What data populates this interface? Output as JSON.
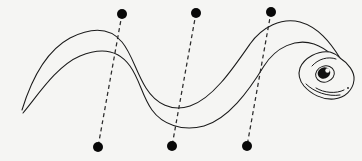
{
  "figure": {
    "background_color": "#f5f5f3",
    "ink_color": "#1a1a1a",
    "width": 362,
    "height": 161
  },
  "subject": {
    "name": "snake",
    "orientation": "head-right",
    "body_style": "double-line sinuous outline",
    "tail_tip": {
      "x": 22,
      "y": 108
    },
    "head_tip": {
      "x": 352,
      "y": 84
    },
    "dorsal_curve": "M 22 110 C 30 84 44 52 70 38 C 96 25 112 30 122 42 C 132 54 136 72 146 88 C 156 104 172 112 190 106 C 212 99 232 70 250 44 C 262 27 282 17 300 22 C 318 27 330 42 340 58",
    "ventral_curve": "M 23 113 C 36 98 56 66 80 56 C 104 46 120 52 130 66 C 140 80 142 96 152 110 C 162 124 182 132 204 126 C 228 119 248 92 264 66 C 276 47 296 38 314 44 C 328 49 338 60 344 72",
    "head": {
      "outline": "M 340 58 C 348 63 355 72 354 80 C 353 90 345 98 334 99 C 322 100 311 94 304 86 C 299 80 298 74 300 68 C 304 58 318 50 330 52 C 334 53 337 55 340 58 Z",
      "mouth_line": "M 316 88 C 324 93 336 94 344 90",
      "jaw_line": "M 306 84 C 314 92 328 97 340 95",
      "brow_line": "M 312 66 C 318 59 328 56 336 59",
      "eye": {
        "center": {
          "x": 325,
          "y": 74
        },
        "rx": 9.5,
        "ry": 8.0,
        "rotation": -18,
        "pupil_center": {
          "x": 324,
          "y": 73
        },
        "pupil_rx": 6.4,
        "pupil_ry": 5.6,
        "highlight_center": {
          "x": 327.5,
          "y": 70.5
        },
        "highlight_r": 2.2
      },
      "nostril": {
        "x": 348,
        "y": 88,
        "r": 0.9
      }
    }
  },
  "transects": [
    {
      "id": "transect-1",
      "label": "left transect",
      "top_point": {
        "x": 122,
        "y": 14
      },
      "bottom_point": {
        "x": 98,
        "y": 147
      },
      "dot_radius": 5.0,
      "dash_pattern": "4 3.2"
    },
    {
      "id": "transect-2",
      "label": "center transect",
      "top_point": {
        "x": 196,
        "y": 13
      },
      "bottom_point": {
        "x": 172,
        "y": 146
      },
      "dot_radius": 5.0,
      "dash_pattern": "4 3.2"
    },
    {
      "id": "transect-3",
      "label": "right transect",
      "top_point": {
        "x": 271,
        "y": 12
      },
      "bottom_point": {
        "x": 247,
        "y": 146
      },
      "dot_radius": 5.0,
      "dash_pattern": "4 3.2"
    }
  ]
}
